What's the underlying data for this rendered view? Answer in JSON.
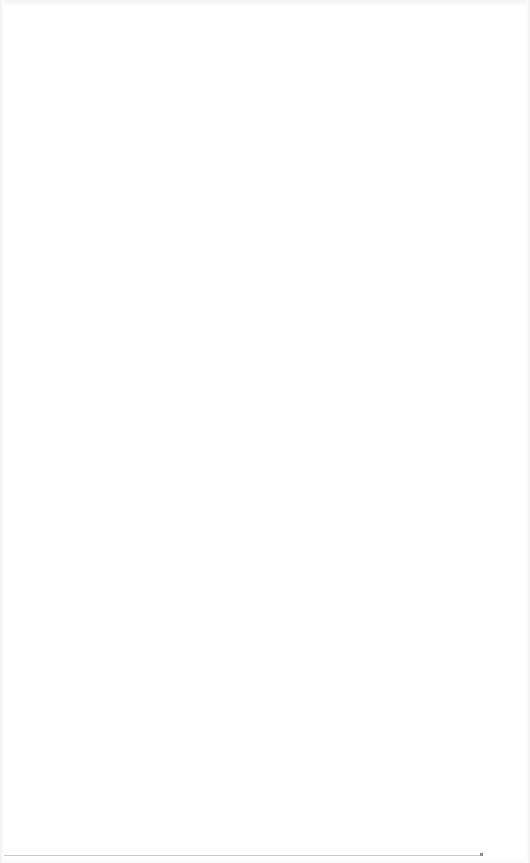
{
  "page": {
    "state": "blank",
    "background_color": "#ffffff"
  },
  "bottom_rule": {
    "color": "#c8c8c8"
  }
}
